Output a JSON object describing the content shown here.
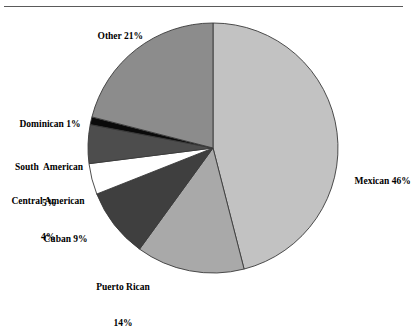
{
  "figure": {
    "background_color": "#ffffff",
    "rule_color": "#5a5a5a"
  },
  "chart_data": {
    "type": "pie",
    "title": "",
    "subtitle": "",
    "xlabel": "",
    "ylabel": "",
    "legend_position": "none",
    "grid": false,
    "start_angle_deg": 90,
    "direction": "clockwise",
    "units": "percent",
    "total": 100,
    "categories": [
      "Mexican",
      "Puerto Rican",
      "Cuban",
      "Central American",
      "South American",
      "Dominican",
      "Other"
    ],
    "values": [
      46,
      14,
      9,
      4,
      5,
      1,
      21
    ],
    "slices": [
      {
        "name": "Mexican",
        "value": 46,
        "value_text": "46%",
        "label": "Mexican 46%",
        "color": "#c2c2c2",
        "edge_color": "#3a3a3a"
      },
      {
        "name": "Puerto Rican",
        "value": 14,
        "value_text": "14%",
        "label_line1": "Puerto Rican",
        "label_line2": "14%",
        "color": "#a9a9a9",
        "edge_color": "#3a3a3a"
      },
      {
        "name": "Cuban",
        "value": 9,
        "value_text": "9%",
        "label": "Cuban 9%",
        "color": "#3f3f3f",
        "edge_color": "#3a3a3a"
      },
      {
        "name": "Central American",
        "value": 4,
        "value_text": "4%",
        "label_line1": "Central American",
        "label_line2": "4%",
        "color": "#ffffff",
        "edge_color": "#3a3a3a"
      },
      {
        "name": "South American",
        "value": 5,
        "value_text": "5%",
        "label_line1": "South  American",
        "label_line2": "5%",
        "color": "#4d4d4d",
        "edge_color": "#3a3a3a"
      },
      {
        "name": "Dominican",
        "value": 1,
        "value_text": "1%",
        "label": "Dominican 1%",
        "color": "#0a0a0a",
        "edge_color": "#3a3a3a"
      },
      {
        "name": "Other",
        "value": 21,
        "value_text": "21%",
        "label": "Other 21%",
        "color": "#8c8c8c",
        "edge_color": "#3a3a3a"
      }
    ]
  }
}
